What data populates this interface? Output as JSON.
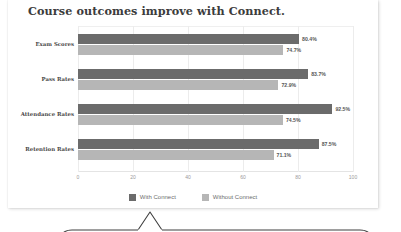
{
  "card": {
    "title": "Course outcomes improve with Connect."
  },
  "chart_data": {
    "type": "bar",
    "orientation": "horizontal",
    "title": "Course outcomes improve with Connect.",
    "xlabel": "",
    "ylabel": "",
    "categories": [
      "Exam Scores",
      "Pass Rates",
      "Attendance Rates",
      "Retention Rates"
    ],
    "series": [
      {
        "name": "With Connect",
        "color": "#6b6b6b",
        "values": [
          80.4,
          83.7,
          92.5,
          87.5
        ],
        "labels": [
          "80.4%",
          "83.7%",
          "92.5%",
          "87.5%"
        ]
      },
      {
        "name": "Without Connect",
        "color": "#b6b6b6",
        "values": [
          74.7,
          72.9,
          74.5,
          71.1
        ],
        "labels": [
          "74.7%",
          "72.9%",
          "74.5%",
          "71.1%"
        ]
      }
    ],
    "xlim": [
      0,
      100
    ],
    "xticks": [
      "0",
      "20",
      "40",
      "60",
      "80",
      "100"
    ],
    "grid": true,
    "legend_position": "bottom"
  },
  "legend": {
    "items": [
      {
        "label": "With Connect",
        "color": "#6b6b6b"
      },
      {
        "label": "Without Connect",
        "color": "#b6b6b6"
      }
    ]
  }
}
